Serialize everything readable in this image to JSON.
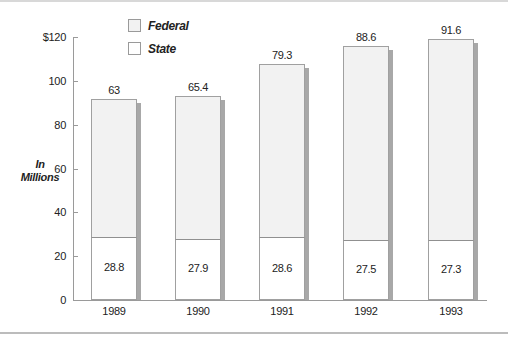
{
  "chart_data": {
    "type": "bar",
    "stacked": true,
    "title": "",
    "xlabel": "",
    "ylabel": "In Millions",
    "ylim": [
      0,
      120
    ],
    "yticks": [
      "0",
      "20",
      "40",
      "60",
      "80",
      "100",
      "$120"
    ],
    "categories": [
      "1989",
      "1990",
      "1991",
      "1992",
      "1993"
    ],
    "series": [
      {
        "name": "State",
        "values": [
          28.8,
          27.9,
          28.6,
          27.5,
          27.3
        ],
        "color": "#ffffff"
      },
      {
        "name": "Federal",
        "values": [
          63,
          65.4,
          79.3,
          88.6,
          91.6
        ],
        "color": "#f2f2f2"
      }
    ],
    "data_labels": {
      "State": [
        "28.8",
        "27.9",
        "28.6",
        "27.5",
        "27.3"
      ],
      "Federal": [
        "63",
        "65.4",
        "79.3",
        "88.6",
        "91.6"
      ]
    },
    "legend": {
      "position": "top",
      "entries": [
        "Federal",
        "State"
      ]
    },
    "grid": false
  },
  "legend": {
    "federal": "Federal",
    "state": "State"
  },
  "axis": {
    "ylabel_line1": "In",
    "ylabel_line2": "Millions",
    "ticks": [
      "0",
      "20",
      "40",
      "60",
      "80",
      "100",
      "$120"
    ]
  }
}
